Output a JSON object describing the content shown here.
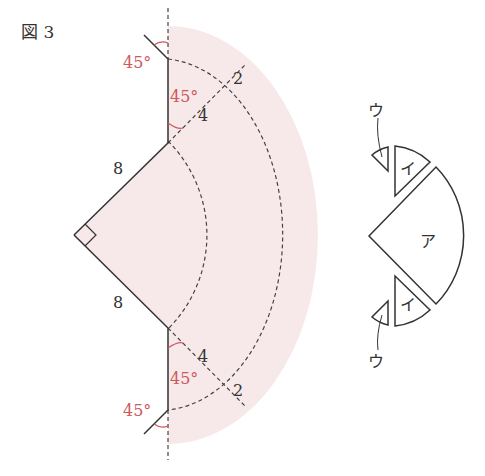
{
  "figure": {
    "label": "図 3"
  },
  "main_diagram": {
    "side_labels": {
      "upper_side": "8",
      "lower_side": "8"
    },
    "angle_labels": {
      "top_outer": "45°",
      "top_inner": "45°",
      "bottom_inner": "45°",
      "bottom_outer": "45°"
    },
    "segment_labels": {
      "top_near": "4",
      "top_far": "2",
      "bottom_near": "4",
      "bottom_far": "2"
    },
    "right_angle_marker": "right-angle",
    "shade_color": "#f7e9ea",
    "angle_color": "#d0575e",
    "line_color": "#333333"
  },
  "pieces_diagram": {
    "center_piece": "ア",
    "upper_middle_piece": "イ",
    "lower_middle_piece": "イ",
    "upper_small_piece": "ウ",
    "lower_small_piece": "ウ"
  }
}
